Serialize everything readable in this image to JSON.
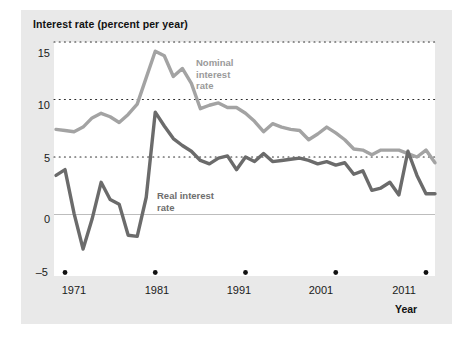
{
  "chart_data": {
    "type": "line",
    "title": "Interest rate (percent per year)",
    "xlabel": "Year",
    "ylabel": "Interest rate (percent per year)",
    "xlim": [
      1970,
      2012
    ],
    "ylim": [
      -5,
      15
    ],
    "yticks": [
      15,
      10,
      5,
      0,
      -5
    ],
    "xticks": [
      1971,
      1981,
      1991,
      2001,
      2011
    ],
    "grid": "horizontal-dotted",
    "legend": "inline-annotations",
    "x": [
      1970,
      1971,
      1972,
      1973,
      1974,
      1975,
      1976,
      1977,
      1978,
      1979,
      1980,
      1981,
      1982,
      1983,
      1984,
      1985,
      1986,
      1987,
      1988,
      1989,
      1990,
      1991,
      1992,
      1993,
      1994,
      1995,
      1996,
      1997,
      1998,
      1999,
      2000,
      2001,
      2002,
      2003,
      2004,
      2005,
      2006,
      2007,
      2008,
      2009,
      2010,
      2011,
      2012
    ],
    "series": [
      {
        "name": "Nominal interest rate",
        "color": "#a3a3a3",
        "label_lines": [
          "Nominal",
          "interest",
          "rate"
        ],
        "values": [
          7.4,
          7.3,
          7.2,
          7.6,
          8.4,
          8.8,
          8.5,
          8.0,
          8.7,
          9.6,
          11.9,
          14.2,
          13.8,
          12.0,
          12.7,
          11.4,
          9.2,
          9.5,
          9.7,
          9.3,
          9.3,
          8.8,
          8.1,
          7.2,
          7.9,
          7.6,
          7.4,
          7.3,
          6.5,
          7.0,
          7.6,
          7.1,
          6.5,
          5.7,
          5.6,
          5.2,
          5.6,
          5.6,
          5.6,
          5.3,
          5.0,
          5.6,
          4.5
        ]
      },
      {
        "name": "Real interest rate",
        "color": "#6b6b6b",
        "label_lines": [
          "Real interest",
          "rate"
        ],
        "values": [
          3.4,
          3.9,
          0.1,
          -3.0,
          -0.4,
          2.8,
          1.3,
          0.9,
          -1.8,
          -1.9,
          1.5,
          8.9,
          7.7,
          6.6,
          6.0,
          5.5,
          4.7,
          4.4,
          4.9,
          5.1,
          3.9,
          5.0,
          4.6,
          5.3,
          4.6,
          4.7,
          4.8,
          4.9,
          4.7,
          4.4,
          4.6,
          4.3,
          4.5,
          3.5,
          3.8,
          2.1,
          2.3,
          2.8,
          1.7,
          5.5,
          3.4,
          1.8,
          1.8
        ]
      }
    ]
  },
  "axis": {
    "title": "Interest rate (percent per year)",
    "x_label": "Year",
    "y_ticks": [
      "15",
      "10",
      "5",
      "0",
      "–5"
    ],
    "x_ticks": [
      "1971",
      "1981",
      "1991",
      "2001",
      "2011"
    ]
  },
  "annotations": {
    "nominal_line1": "Nominal",
    "nominal_line2": "interest",
    "nominal_line3": "rate",
    "real_line1": "Real interest",
    "real_line2": "rate"
  },
  "colors": {
    "nominal": "#a3a3a3",
    "real": "#6b6b6b",
    "panel": "#e9e9e9",
    "plot": "#ffffff",
    "grid": "#2b2b2b",
    "zero_line": "#bdbdbd"
  }
}
